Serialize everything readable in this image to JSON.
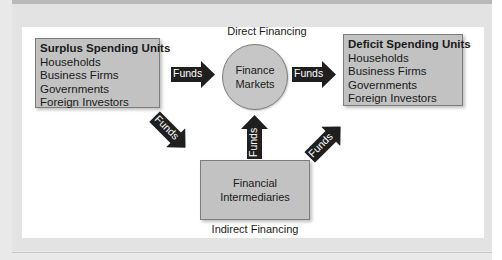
{
  "diagram": {
    "direct_label": "Direct Financing",
    "indirect_label": "Indirect Financing",
    "surplus": {
      "title": "Surplus Spending Units",
      "items": [
        "Households",
        "Business Firms",
        "Governments",
        "Foreign Investors"
      ]
    },
    "deficit": {
      "title": "Deficit Spending Units",
      "items": [
        "Households",
        "Business Firms",
        "Governments",
        "Foreign Investors"
      ]
    },
    "markets": {
      "line1": "Finance",
      "line2": "Markets"
    },
    "intermediaries": {
      "line1": "Financial",
      "line2": "Intermediaries"
    },
    "arrows": {
      "surplus_to_markets": "Funds",
      "markets_to_deficit": "Funds",
      "surplus_to_intermediaries": "Funds",
      "intermediaries_to_markets": "Funds",
      "intermediaries_to_deficit": "Funds"
    },
    "colors": {
      "box_fill": "#c2c2c2",
      "arrow_fill": "#1f1f1f",
      "panel_bg": "#e3e3e3",
      "inner_bg": "#ffffff"
    }
  }
}
